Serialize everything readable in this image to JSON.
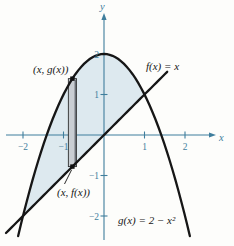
{
  "figure": {
    "background_color": "#fdfdfb",
    "axis_color": "#3f7e9d",
    "curve_color": "#161616",
    "shade_color": "#dde9ef",
    "strip_fill_color": "#c9ced3",
    "labels": {
      "y_axis": "y",
      "x_axis": "x",
      "f_label": "f(x) = x",
      "g_label": "g(x) = 2 − x²",
      "top_point": "(x, g(x))",
      "bottom_point": "(x, f(x))"
    }
  },
  "chart_data": {
    "type": "line",
    "title": "",
    "xlabel": "x",
    "ylabel": "y",
    "grid": false,
    "functions": [
      {
        "name": "f",
        "label": "f(x) = x",
        "formula": "f(x) = x",
        "poly_coeffs": [
          0,
          1,
          0
        ],
        "draw_domain": [
          -2.42,
          1.56
        ],
        "color": "#161616"
      },
      {
        "name": "g",
        "label": "g(x) = 2 − x²",
        "formula": "g(x) = 2 - x^2",
        "poly_coeffs": [
          -1,
          0,
          2
        ],
        "draw_domain": [
          -2.12,
          2.12
        ],
        "color": "#161616"
      }
    ],
    "intersections": [
      [
        -2,
        -2
      ],
      [
        1,
        1
      ]
    ],
    "shaded_region": {
      "between": [
        "f",
        "g"
      ],
      "x_range": [
        -2,
        1
      ],
      "color": "#dde9ef"
    },
    "representative_rectangle": {
      "x_center": -0.78,
      "half_width": 0.1,
      "top_on": "g",
      "bottom_on": "f",
      "top_label": "(x, g(x))",
      "bottom_label": "(x, f(x))",
      "fill": "#c9ced3"
    },
    "axes": {
      "x": {
        "label": "x",
        "ticks": [
          -2,
          -1,
          1,
          2
        ],
        "tick_labels": [
          "−2",
          "−1",
          "1",
          "2"
        ],
        "range": [
          -2.55,
          2.75
        ]
      },
      "y": {
        "label": "y",
        "ticks": [
          2,
          1,
          -1,
          -2
        ],
        "tick_labels": [
          "2",
          "1",
          "−1",
          "−2"
        ],
        "range": [
          -2.75,
          3.0
        ]
      }
    }
  }
}
